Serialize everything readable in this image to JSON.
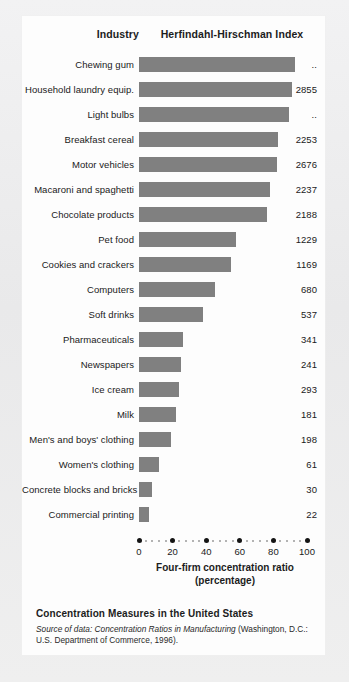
{
  "header": {
    "industry_label": "Industry",
    "hhi_label": "Herfindahl-Hirschman Index"
  },
  "caption": {
    "title": "Concentration Measures in the United States",
    "source_prefix": "Source of data:",
    "source_italic": "Concentration Ratios in Manufacturing",
    "source_rest": "(Washington, D.C.: U.S. Department of Commerce, 1996)."
  },
  "axis": {
    "title_line1": "Four-firm concentration ratio",
    "title_line2": "(percentage)",
    "ticks": [
      "0",
      "20",
      "40",
      "60",
      "80",
      "100"
    ]
  },
  "colors": {
    "bar": "#808080",
    "card": "#fdfdfd",
    "page": "#ececed",
    "text": "#1a1a1a"
  },
  "chart_data": {
    "type": "bar",
    "orientation": "horizontal",
    "title": "Concentration Measures in the United States",
    "xlabel": "Four-firm concentration ratio (percentage)",
    "ylabel": "Industry",
    "xlim": [
      0,
      100
    ],
    "xticks": [
      0,
      20,
      40,
      60,
      80,
      100
    ],
    "grid": false,
    "legend": "none",
    "value_column_header": "Herfindahl-Hirschman Index",
    "categories": [
      "Chewing gum",
      "Household laundry equip.",
      "Light bulbs",
      "Breakfast cereal",
      "Motor vehicles",
      "Macaroni and spaghetti",
      "Chocolate products",
      "Pet food",
      "Cookies and crackers",
      "Computers",
      "Soft drinks",
      "Pharmaceuticals",
      "Newspapers",
      "Ice cream",
      "Milk",
      "Men's and boys' clothing",
      "Women's clothing",
      "Concrete blocks and bricks",
      "Commercial printing"
    ],
    "values": [
      93,
      91,
      89,
      83,
      82,
      78,
      76,
      58,
      55,
      45,
      38,
      26,
      25,
      24,
      22,
      19,
      12,
      8,
      6
    ],
    "hhi_values": [
      "..",
      "2855",
      "..",
      "2253",
      "2676",
      "2237",
      "2188",
      "1229",
      "1169",
      "680",
      "537",
      "341",
      "241",
      "293",
      "181",
      "198",
      "61",
      "30",
      "22"
    ],
    "rows": [
      {
        "industry": "Chewing gum",
        "ratio": 93,
        "hhi": ".."
      },
      {
        "industry": "Household laundry equip.",
        "ratio": 91,
        "hhi": "2855"
      },
      {
        "industry": "Light bulbs",
        "ratio": 89,
        "hhi": ".."
      },
      {
        "industry": "Breakfast cereal",
        "ratio": 83,
        "hhi": "2253"
      },
      {
        "industry": "Motor vehicles",
        "ratio": 82,
        "hhi": "2676"
      },
      {
        "industry": "Macaroni and spaghetti",
        "ratio": 78,
        "hhi": "2237"
      },
      {
        "industry": "Chocolate products",
        "ratio": 76,
        "hhi": "2188"
      },
      {
        "industry": "Pet food",
        "ratio": 58,
        "hhi": "1229"
      },
      {
        "industry": "Cookies and crackers",
        "ratio": 55,
        "hhi": "1169"
      },
      {
        "industry": "Computers",
        "ratio": 45,
        "hhi": "680"
      },
      {
        "industry": "Soft drinks",
        "ratio": 38,
        "hhi": "537"
      },
      {
        "industry": "Pharmaceuticals",
        "ratio": 26,
        "hhi": "341"
      },
      {
        "industry": "Newspapers",
        "ratio": 25,
        "hhi": "241"
      },
      {
        "industry": "Ice cream",
        "ratio": 24,
        "hhi": "293"
      },
      {
        "industry": "Milk",
        "ratio": 22,
        "hhi": "181"
      },
      {
        "industry": "Men's and boys' clothing",
        "ratio": 19,
        "hhi": "198"
      },
      {
        "industry": "Women's clothing",
        "ratio": 12,
        "hhi": "61"
      },
      {
        "industry": "Concrete blocks and bricks",
        "ratio": 8,
        "hhi": "30"
      },
      {
        "industry": "Commercial printing",
        "ratio": 6,
        "hhi": "22"
      }
    ]
  }
}
